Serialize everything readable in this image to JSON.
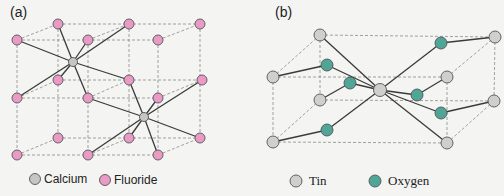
{
  "colors": {
    "calcium": "#c6c6c6",
    "fluoride": "#e99bc5",
    "tin": "#cfcfcf",
    "oxygen": "#4fa596"
  },
  "panel_a": {
    "label": "(a)",
    "title": "Calcium fluoride (fluorite) crystal structure",
    "legend": [
      {
        "name": "Calcium",
        "color_key": "calcium"
      },
      {
        "name": "Fluoride",
        "color_key": "fluoride"
      }
    ]
  },
  "panel_b": {
    "label": "(b)",
    "title": "Tin oxide (rutile-type) crystal structure",
    "legend": [
      {
        "name": "Tin",
        "color_key": "tin"
      },
      {
        "name": "Oxygen",
        "color_key": "oxygen"
      }
    ]
  }
}
